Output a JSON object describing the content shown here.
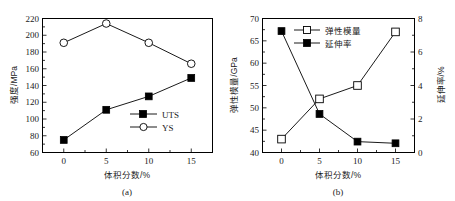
{
  "figure": {
    "width": 455,
    "height": 201,
    "background": "#ffffff",
    "line_color": "#000000"
  },
  "chart_data": [
    {
      "type": "line",
      "panel_label": "(a)",
      "title": "",
      "xlabel": "体积分数/%",
      "ylabel": "强度/MPa",
      "x": [
        0,
        5,
        10,
        15
      ],
      "xtick_labels": [
        "0",
        "5",
        "10",
        "15"
      ],
      "xlim": [
        -2.5,
        17.5
      ],
      "ylim": [
        60,
        220
      ],
      "ytick_labels": [
        "60",
        "80",
        "100",
        "120",
        "140",
        "160",
        "180",
        "200",
        "220"
      ],
      "yticks": [
        60,
        80,
        100,
        120,
        140,
        160,
        180,
        200,
        220
      ],
      "grid": false,
      "legend_position": "lower right inside",
      "series": [
        {
          "name": "UTS",
          "marker": "filled-square",
          "values": [
            75,
            111,
            127,
            149
          ]
        },
        {
          "name": "YS",
          "marker": "open-circle",
          "values": [
            191,
            214,
            191,
            166
          ]
        }
      ]
    },
    {
      "type": "line",
      "panel_label": "(b)",
      "title": "",
      "xlabel": "体积分数/%",
      "ylabel": "弹性模量/GPa",
      "ylabel_right": "延伸率/%",
      "x": [
        0,
        5,
        10,
        15
      ],
      "xtick_labels": [
        "0",
        "5",
        "10",
        "15"
      ],
      "xlim": [
        -2.5,
        17.5
      ],
      "ylim": [
        40,
        70
      ],
      "ytick_labels": [
        "40",
        "45",
        "50",
        "55",
        "60",
        "65",
        "70"
      ],
      "yticks": [
        40,
        45,
        50,
        55,
        60,
        65,
        70
      ],
      "ylim_right": [
        0,
        8
      ],
      "ytick_labels_right": [
        "0",
        "2",
        "4",
        "6",
        "8"
      ],
      "yticks_right": [
        0,
        2,
        4,
        6,
        8
      ],
      "grid": false,
      "legend_position": "upper center inside",
      "series": [
        {
          "name": "弹性模量",
          "marker": "open-square",
          "axis": "left",
          "values": [
            43.0,
            52.0,
            55.0,
            67.0
          ]
        },
        {
          "name": "延伸率",
          "marker": "filled-square",
          "axis": "right",
          "values": [
            7.25,
            2.3,
            0.65,
            0.55
          ]
        }
      ]
    }
  ]
}
